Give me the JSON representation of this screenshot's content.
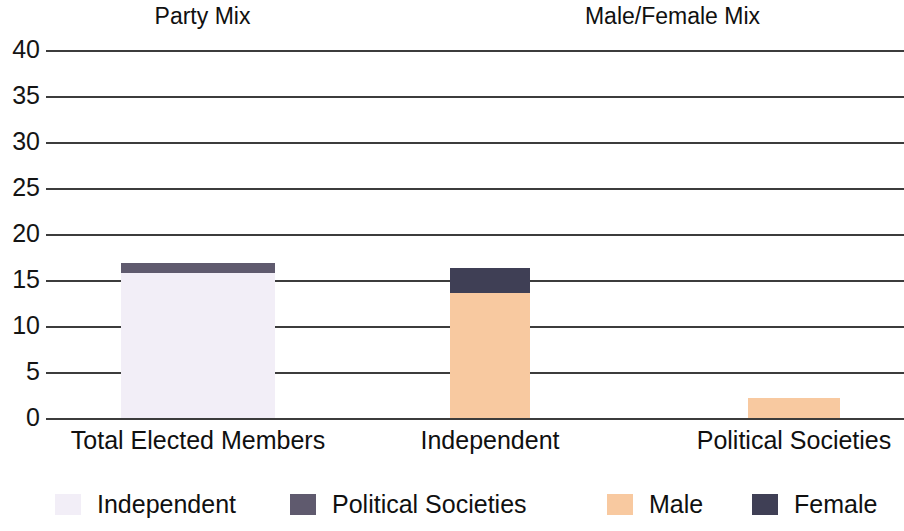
{
  "titles": {
    "left": "Party Mix",
    "right": "Male/Female Mix"
  },
  "axis": {
    "ticks": [
      "40",
      "35",
      "30",
      "25",
      "20",
      "15",
      "10",
      "5",
      "0"
    ]
  },
  "categories": [
    "Total Elected Members",
    "Independent",
    "Political Societies"
  ],
  "legend": [
    {
      "label": "Independent",
      "color": "#f2eef7"
    },
    {
      "label": "Political Societies",
      "color": "#5f5a6e"
    },
    {
      "label": "Male",
      "color": "#f8c9a0"
    },
    {
      "label": "Female",
      "color": "#3f3f55"
    }
  ],
  "chart_data": {
    "type": "bar",
    "xlabel": "",
    "ylabel": "",
    "ylim": [
      0,
      40
    ],
    "ytick_step": 5,
    "grid": true,
    "stacked": true,
    "legend_position": "bottom",
    "categories": [
      "Total Elected Members",
      "Independent",
      "Political Societies"
    ],
    "series": [
      {
        "name": "Independent",
        "color": "#f2eef7",
        "values": [
          15.8,
          0,
          0
        ]
      },
      {
        "name": "Political Societies",
        "color": "#5f5a6e",
        "values": [
          1.0,
          0,
          0
        ]
      },
      {
        "name": "Male",
        "color": "#f8c9a0",
        "values": [
          0,
          13.6,
          2.2
        ]
      },
      {
        "name": "Female",
        "color": "#3f3f55",
        "values": [
          0,
          2.7,
          0
        ]
      }
    ],
    "totals": [
      16.8,
      16.3,
      2.2
    ],
    "panels": [
      {
        "title": "Party Mix",
        "categories": [
          "Total Elected Members"
        ]
      },
      {
        "title": "Male/Female Mix",
        "categories": [
          "Independent",
          "Political Societies"
        ]
      }
    ]
  }
}
